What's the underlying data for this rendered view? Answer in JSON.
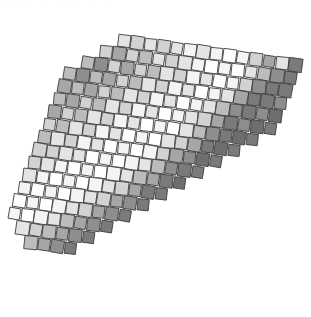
{
  "figure": {
    "type": "mosaic-grid",
    "background_color": "#ffffff",
    "canvas": {
      "width": 311,
      "height": 317
    },
    "top_text_remnant": "· ·  ·   ·  ·· ·   ·  ·",
    "grid": {
      "cols": 17,
      "rows": 17,
      "cell_size": 12.4,
      "gap": 0.9,
      "origin_x": 150,
      "origin_y": 152,
      "rotation_deg": 8,
      "shear_x": -0.24,
      "shear_y": 0.0,
      "outline_color": "#3c3c3c",
      "outline_width": 0.85
    },
    "palette": {
      "white": "#ffffff",
      "near_white": "#f4f4f4",
      "light": "#e4e4e4",
      "light_mid": "#d2d2d2",
      "mid": "#bcbcbc",
      "mid_dark": "#a6a6a6",
      "dark": "#8e8e8e",
      "darker": "#7a7a7a",
      "darkest": "#6e6e6e"
    },
    "shade_levels": [
      "#ffffff",
      "#f4f4f4",
      "#e4e4e4",
      "#d2d2d2",
      "#bcbcbc",
      "#a6a6a6",
      "#8e8e8e",
      "#7a7a7a",
      "#6e6e6e"
    ]
  },
  "chart_data": {
    "type": "heatmap",
    "xlabel": "",
    "ylabel": "",
    "grid": true,
    "legend": "none",
    "cols": 17,
    "rows": 17,
    "value_range": [
      0,
      8
    ],
    "colormap": [
      "#ffffff",
      "#f4f4f4",
      "#e4e4e4",
      "#d2d2d2",
      "#bcbcbc",
      "#a6a6a6",
      "#8e8e8e",
      "#7a7a7a",
      "#6e6e6e"
    ],
    "note": "Value = shade index; 0 = white, 8 = darkest gray. Rows run top-left to bottom-right of the rotated field. Blank cells (null) lie outside the clipped diamond outline.",
    "values": [
      [
        null,
        null,
        null,
        2,
        3,
        2,
        3,
        2,
        1,
        2,
        1,
        0,
        1,
        3,
        5,
        2,
        7
      ],
      [
        null,
        null,
        3,
        5,
        3,
        4,
        2,
        3,
        2,
        1,
        0,
        1,
        0,
        2,
        4,
        6,
        7
      ],
      [
        null,
        4,
        6,
        3,
        5,
        3,
        4,
        2,
        3,
        1,
        2,
        0,
        1,
        3,
        6,
        7,
        7
      ],
      [
        4,
        6,
        4,
        5,
        3,
        4,
        2,
        3,
        1,
        2,
        0,
        1,
        2,
        5,
        7,
        7,
        6
      ],
      [
        5,
        4,
        5,
        3,
        4,
        2,
        3,
        1,
        2,
        0,
        1,
        2,
        4,
        6,
        7,
        6,
        8
      ],
      [
        4,
        5,
        3,
        4,
        2,
        3,
        1,
        2,
        0,
        1,
        2,
        3,
        5,
        7,
        6,
        8,
        7
      ],
      [
        5,
        3,
        4,
        2,
        3,
        1,
        2,
        0,
        1,
        0,
        2,
        4,
        6,
        7,
        8,
        7,
        null
      ],
      [
        3,
        4,
        2,
        3,
        1,
        2,
        0,
        1,
        0,
        2,
        3,
        5,
        7,
        8,
        7,
        null,
        null
      ],
      [
        4,
        2,
        3,
        1,
        2,
        0,
        1,
        0,
        1,
        3,
        5,
        6,
        8,
        7,
        null,
        null,
        null
      ],
      [
        3,
        3,
        2,
        2,
        0,
        1,
        0,
        1,
        2,
        4,
        6,
        7,
        7,
        null,
        null,
        null,
        null
      ],
      [
        3,
        2,
        1,
        0,
        1,
        0,
        1,
        2,
        4,
        5,
        7,
        8,
        null,
        null,
        null,
        null,
        null
      ],
      [
        2,
        1,
        0,
        1,
        0,
        1,
        2,
        3,
        5,
        7,
        7,
        null,
        null,
        null,
        null,
        null,
        null
      ],
      [
        1,
        0,
        1,
        0,
        1,
        2,
        3,
        5,
        6,
        7,
        null,
        null,
        null,
        null,
        null,
        null,
        null
      ],
      [
        0,
        1,
        0,
        1,
        2,
        3,
        5,
        6,
        7,
        null,
        null,
        null,
        null,
        null,
        null,
        null,
        null
      ],
      [
        1,
        0,
        1,
        2,
        4,
        5,
        6,
        7,
        null,
        null,
        null,
        null,
        null,
        null,
        null,
        null,
        null
      ],
      [
        null,
        2,
        3,
        4,
        5,
        6,
        7,
        null,
        null,
        null,
        null,
        null,
        null,
        null,
        null,
        null,
        null
      ],
      [
        null,
        null,
        4,
        5,
        6,
        7,
        null,
        null,
        null,
        null,
        null,
        null,
        null,
        null,
        null,
        null,
        null
      ]
    ]
  }
}
